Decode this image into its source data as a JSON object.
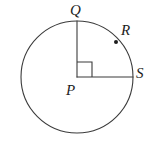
{
  "figure": {
    "kind": "geometry-diagram",
    "background_color": "#ffffff",
    "stroke_color": "#3b3b3b",
    "label_color": "#1d1d1d",
    "stroke_width": 1,
    "circle": {
      "center_x": 77,
      "center_y": 77,
      "radius": 56
    },
    "right_angle_marker": {
      "size": 15,
      "vertex_x": 77,
      "vertex_y": 77
    },
    "points": {
      "center": {
        "label": "P",
        "x": 77,
        "y": 77
      },
      "top": {
        "label": "Q",
        "x": 77,
        "y": 21
      },
      "arc": {
        "label": "R",
        "x": 116,
        "y": 42,
        "dot_radius": 2
      },
      "right": {
        "label": "S",
        "x": 133,
        "y": 77
      }
    },
    "radii": [
      {
        "name": "PQ",
        "from": "P",
        "to": "Q"
      },
      {
        "name": "PS",
        "from": "P",
        "to": "S"
      }
    ]
  }
}
